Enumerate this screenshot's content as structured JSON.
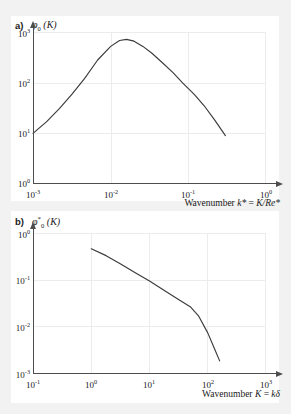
{
  "figure": {
    "background_color": "#f2f2f2",
    "panel_color": "#ffffff",
    "curve_color": "#3b3b3b",
    "axis_color": "#4d4d4d",
    "grid_color": "#ececec"
  },
  "panel_a": {
    "tag": "a)",
    "ylabel_phi": "φ",
    "ylabel_sub": "0",
    "ylabel_arg": " (K)",
    "x_caption_prefix": "Wavenumber ",
    "x_caption_var": "k*",
    "x_caption_eq": " = ",
    "x_caption_expr": "K/Re*",
    "yticks": [
      "10",
      "10",
      "10",
      "10"
    ],
    "ytick_exps": [
      "3",
      "2",
      "1",
      "0"
    ],
    "xticks": [
      "10",
      "10",
      "10",
      "10"
    ],
    "xtick_exps": [
      "-3",
      "-2",
      "-1",
      "0"
    ]
  },
  "panel_b": {
    "tag": "b)",
    "ylabel_phi": "φ",
    "ylabel_sub": "0",
    "ylabel_sup": "*",
    "ylabel_arg": " (K)",
    "x_caption_prefix": "Wavenumber ",
    "x_caption_var": "K",
    "x_caption_eq": " = ",
    "x_caption_expr": "kδ",
    "yticks": [
      "10",
      "10",
      "10",
      "10"
    ],
    "ytick_exps": [
      "0",
      "-1",
      "-2",
      "-3"
    ],
    "xticks": [
      "10",
      "10",
      "10",
      "10",
      "10"
    ],
    "xtick_exps": [
      "-1",
      "0",
      "1",
      "2",
      "3"
    ]
  },
  "chart_data": [
    {
      "type": "line",
      "id": "panel-a",
      "title": "a) φ₀ (K)",
      "xlabel": "Wavenumber k* = K/Re*",
      "ylabel": "φ₀ (K)",
      "xscale": "log",
      "yscale": "log",
      "xlim": [
        0.001,
        1.0
      ],
      "ylim": [
        1.0,
        1000.0
      ],
      "xticks": [
        0.001,
        0.01,
        0.1,
        1.0
      ],
      "yticks": [
        1.0,
        10.0,
        100.0,
        1000.0
      ],
      "grid": true,
      "legend": "none",
      "series": [
        {
          "name": "spectrum",
          "x": [
            0.001,
            0.0015,
            0.0022,
            0.0032,
            0.0046,
            0.0068,
            0.01,
            0.013,
            0.016,
            0.02,
            0.026,
            0.034,
            0.046,
            0.063,
            0.085,
            0.12,
            0.16,
            0.22,
            0.3
          ],
          "y": [
            10.0,
            17.0,
            31.0,
            60.0,
            120.0,
            280.0,
            520.0,
            680.0,
            715.0,
            660.0,
            520.0,
            380.0,
            250.0,
            160.0,
            98.0,
            58.0,
            35.0,
            18.0,
            9.0
          ]
        }
      ]
    },
    {
      "type": "line",
      "id": "panel-b",
      "title": "b) φ₀* (K)",
      "xlabel": "Wavenumber K = kδ",
      "ylabel": "φ₀* (K)",
      "xscale": "log",
      "yscale": "log",
      "xlim": [
        0.1,
        1000.0
      ],
      "ylim": [
        0.001,
        1.0
      ],
      "xticks": [
        0.1,
        1.0,
        10.0,
        100.0,
        1000.0
      ],
      "yticks": [
        0.001,
        0.01,
        0.1,
        1.0
      ],
      "grid": true,
      "legend": "none",
      "series": [
        {
          "name": "spectrum",
          "x": [
            1.0,
            1.8,
            3.2,
            5.6,
            10.0,
            18.0,
            32.0,
            50.0,
            70.0,
            100.0,
            130.0,
            160.0
          ],
          "y": [
            0.46,
            0.33,
            0.22,
            0.145,
            0.095,
            0.06,
            0.038,
            0.027,
            0.017,
            0.0075,
            0.0035,
            0.0019
          ]
        }
      ]
    }
  ]
}
